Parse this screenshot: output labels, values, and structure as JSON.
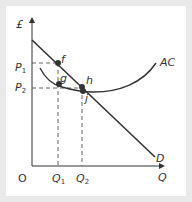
{
  "diagram": {
    "title": "",
    "axes": {
      "y_label": "£",
      "x_label": "Q",
      "origin_label": "O"
    },
    "curves": [
      {
        "id": "D",
        "label": "D",
        "type": "demand",
        "shape": "straight line, downward sloping"
      },
      {
        "id": "AC",
        "label": "AC",
        "type": "average cost",
        "shape": "U-shaped curve"
      }
    ],
    "points": [
      {
        "label": "f",
        "on": "D",
        "at": "Q1, P1"
      },
      {
        "label": "g",
        "on": "AC",
        "at": "Q1"
      },
      {
        "label": "h",
        "on": "D/AC intersection region",
        "at": "Q2"
      },
      {
        "label": "j",
        "on": "AC",
        "at": "Q2, P2"
      }
    ],
    "price_ticks": [
      {
        "label": "P",
        "sub": "1"
      },
      {
        "label": "P",
        "sub": "2"
      }
    ],
    "quantity_ticks": [
      {
        "label": "Q",
        "sub": "1"
      },
      {
        "label": "Q",
        "sub": "2"
      }
    ],
    "colors": {
      "line": "#333333",
      "dash": "#555555",
      "background": "#ffffff",
      "frame": "#e9e9e9"
    }
  }
}
